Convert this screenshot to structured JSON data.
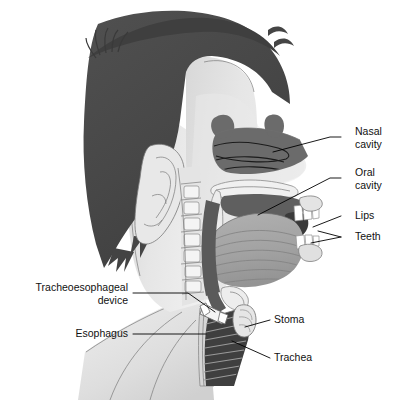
{
  "figure": {
    "background_color": "#ffffff",
    "width": 407,
    "height": 405
  },
  "palette": {
    "background": "#ffffff",
    "hair": "#4a4a4a",
    "hair_dark": "#3d3d3d",
    "skin": "#e2e2e2",
    "skin_shadow": "#d2d2d2",
    "skin_light": "#eeeeee",
    "cavity_dark": "#6b6b6b",
    "cavity_darker": "#5a5a5a",
    "tongue": "#a6a6a6",
    "tongue_shade": "#9a9a9a",
    "teeth": "#ffffff",
    "trachea_dark": "#3a3a3a",
    "device": "#f2f2f2",
    "leader_line": "#000000",
    "label_text": "#111111",
    "outline": "#6f6f6f"
  },
  "labels": [
    {
      "id": "nasal-cavity",
      "lines": [
        "Nasal",
        "cavity"
      ],
      "align": "left",
      "text_x": 355,
      "text_y": 136,
      "leader": "M 341 137 L 330 137 L 273 152"
    },
    {
      "id": "oral-cavity",
      "lines": [
        "Oral",
        "cavity"
      ],
      "align": "left",
      "text_x": 355,
      "text_y": 177,
      "leader": "M 341 178 L 330 178 L 258 215"
    },
    {
      "id": "lips",
      "lines": [
        "Lips"
      ],
      "align": "left",
      "text_x": 355,
      "text_y": 216,
      "leader": "M 341 216 L 313 227"
    },
    {
      "id": "teeth",
      "lines": [
        "Teeth"
      ],
      "align": "left",
      "text_x": 355,
      "text_y": 237,
      "leader": "M 341 237 L 318 231 M 341 237 L 311 243"
    },
    {
      "id": "stoma",
      "lines": [
        "Stoma"
      ],
      "align": "left",
      "text_x": 274,
      "text_y": 320,
      "leader": "M 270 320 L 245 327"
    },
    {
      "id": "trachea",
      "lines": [
        "Trachea"
      ],
      "align": "left",
      "text_x": 274,
      "text_y": 358,
      "leader": "M 270 358 L 232 341"
    },
    {
      "id": "tracheoesophageal-device",
      "lines": [
        "Tracheoesophageal",
        "device"
      ],
      "align": "right",
      "text_x": 128,
      "text_y": 292,
      "leader": "M 133 293 L 188 293 L 215 312"
    },
    {
      "id": "esophagus",
      "lines": [
        "Esophagus"
      ],
      "align": "right",
      "text_x": 128,
      "text_y": 334,
      "leader": "M 133 334 L 206 334"
    }
  ],
  "structures": [
    {
      "id": "hair",
      "name": "Hair"
    },
    {
      "id": "face-skin",
      "name": "Face and neck skin"
    },
    {
      "id": "ear",
      "name": "Ear"
    },
    {
      "id": "cervical-spine",
      "name": "Cervical spine"
    },
    {
      "id": "nasal-cavity-region",
      "name": "Nasal cavity"
    },
    {
      "id": "turbinates",
      "name": "Nasal turbinates"
    },
    {
      "id": "soft-palate",
      "name": "Soft palate"
    },
    {
      "id": "oral-cavity-region",
      "name": "Oral cavity"
    },
    {
      "id": "tongue",
      "name": "Tongue"
    },
    {
      "id": "teeth-upper",
      "name": "Upper teeth"
    },
    {
      "id": "teeth-lower",
      "name": "Lower teeth"
    },
    {
      "id": "lips-region",
      "name": "Lips"
    },
    {
      "id": "pharynx",
      "name": "Pharynx"
    },
    {
      "id": "esophagus-tube",
      "name": "Esophagus"
    },
    {
      "id": "trachea-tube",
      "name": "Trachea"
    },
    {
      "id": "stoma-opening",
      "name": "Stoma"
    },
    {
      "id": "te-device",
      "name": "Tracheoesophageal device"
    },
    {
      "id": "shoulder",
      "name": "Shoulder"
    }
  ]
}
